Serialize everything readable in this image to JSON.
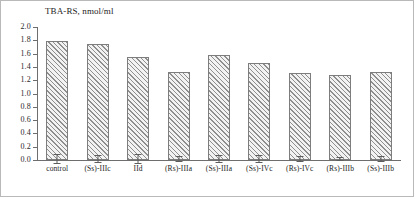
{
  "chart_data": {
    "type": "bar",
    "title": "TBA-RS, nmol/ml",
    "xlabel": "",
    "ylabel": "",
    "ylim": [
      0.0,
      2.0
    ],
    "ytick_step": 0.2,
    "grid": false,
    "legend": "none",
    "categories": [
      "control",
      "(Ss)-IIIc",
      "IId",
      "(Rs)-IIIa",
      "(Ss)-IIIa",
      "(Ss)-IVc",
      "(Rs)-IVc",
      "(Rs)-IIIb",
      "(Ss)-IIIb"
    ],
    "values": [
      1.79,
      1.74,
      1.55,
      1.32,
      1.58,
      1.46,
      1.31,
      1.28,
      1.33
    ],
    "errors": [
      0.07,
      0.06,
      0.07,
      0.05,
      0.06,
      0.06,
      0.05,
      0.03,
      0.05
    ],
    "ytick_labels": [
      "2.0",
      "1.8",
      "1.6",
      "1.4",
      "1.2",
      "1.0",
      "0.8",
      "0.6",
      "0.4",
      "0.2",
      "0.0"
    ],
    "ytick_values": [
      2.0,
      1.8,
      1.6,
      1.4,
      1.2,
      1.0,
      0.8,
      0.6,
      0.4,
      0.2,
      0.0
    ],
    "bar_style": "diagonal-hatch",
    "error_bar_style": "capped"
  },
  "colors": {
    "bar_hatch": "#8e8e8e",
    "bar_fill": "#f2f2f2",
    "bar_outline": "#7d7d7d",
    "axis": "#6e6e6e",
    "text": "#1c1c1c",
    "frame": "#b9b9b9"
  }
}
